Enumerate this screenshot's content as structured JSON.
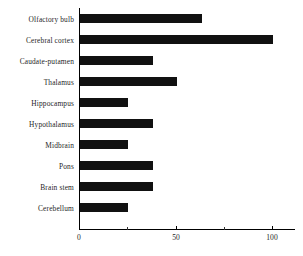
{
  "chart_data": {
    "type": "bar",
    "orientation": "horizontal",
    "title": "",
    "xlabel": "",
    "ylabel": "",
    "xlim": [
      0,
      112
    ],
    "xticks": [
      0,
      50,
      100
    ],
    "xticks_minor": [
      25,
      75
    ],
    "grid": false,
    "legend": null,
    "bar_color": "#111111",
    "axis_color": "#000000",
    "background": "#ffffff",
    "categories": [
      "Olfactory bulb",
      "Cerebral cortex",
      "Caudate-putamen",
      "Thalamus",
      "Hippocampus",
      "Hypothalamus",
      "Midbrain",
      "Pons",
      "Brain stem",
      "Cerebellum"
    ],
    "values": [
      63,
      100,
      38,
      50,
      25,
      38,
      25,
      38,
      38,
      25
    ]
  }
}
